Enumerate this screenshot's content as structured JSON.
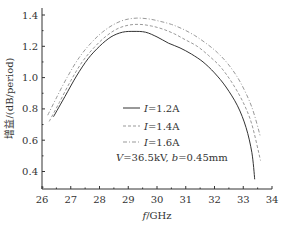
{
  "chart_data": {
    "type": "line",
    "title": "",
    "xlabel": "f/GHz",
    "ylabel": "增益/(dB/period)",
    "xlim": [
      26,
      34
    ],
    "ylim": [
      0.29,
      1.42
    ],
    "xticks": [
      26,
      27,
      28,
      29,
      30,
      31,
      32,
      33,
      34
    ],
    "yticks": [
      0.4,
      0.6,
      0.8,
      1.0,
      1.2,
      1.4
    ],
    "xtick_labels": [
      "26",
      "27",
      "28",
      "29",
      "30",
      "31",
      "32",
      "33",
      "34"
    ],
    "ytick_labels": [
      "0.4",
      "0.6",
      "0.8",
      "1.0",
      "1.2",
      "1.4"
    ],
    "grid": false,
    "legend_position": "center-right, inside",
    "annotation": "V=36.5kV, b=0.45mm",
    "series": [
      {
        "name": "I=1.2A",
        "style": "solid",
        "color": "#333333",
        "x": [
          26.4,
          26.8,
          27.2,
          27.6,
          28.0,
          28.4,
          28.8,
          29.2,
          29.6,
          30.0,
          30.4,
          30.8,
          31.2,
          31.6,
          32.0,
          32.4,
          32.8,
          33.1,
          33.3,
          33.4
        ],
        "y": [
          0.75,
          0.88,
          1.01,
          1.12,
          1.2,
          1.26,
          1.29,
          1.295,
          1.29,
          1.26,
          1.22,
          1.19,
          1.15,
          1.1,
          1.03,
          0.94,
          0.82,
          0.68,
          0.52,
          0.35
        ]
      },
      {
        "name": "I=1.4A",
        "style": "dashed",
        "color": "#999999",
        "x": [
          26.25,
          26.6,
          27.0,
          27.4,
          27.8,
          28.2,
          28.6,
          29.0,
          29.4,
          29.8,
          30.2,
          30.6,
          31.0,
          31.4,
          31.8,
          32.2,
          32.6,
          33.0,
          33.3,
          33.6
        ],
        "y": [
          0.72,
          0.84,
          0.98,
          1.1,
          1.19,
          1.26,
          1.31,
          1.335,
          1.34,
          1.33,
          1.31,
          1.28,
          1.24,
          1.2,
          1.14,
          1.07,
          0.97,
          0.84,
          0.7,
          0.47
        ]
      },
      {
        "name": "I=1.6A",
        "style": "dash-dot",
        "color": "#999999",
        "x": [
          26.2,
          26.5,
          26.9,
          27.3,
          27.7,
          28.1,
          28.5,
          28.9,
          29.3,
          29.7,
          30.1,
          30.5,
          30.9,
          31.3,
          31.7,
          32.1,
          32.5,
          32.9,
          33.3,
          33.6
        ],
        "y": [
          0.76,
          0.87,
          1.01,
          1.13,
          1.22,
          1.29,
          1.34,
          1.37,
          1.38,
          1.375,
          1.36,
          1.34,
          1.31,
          1.27,
          1.22,
          1.16,
          1.08,
          0.97,
          0.81,
          0.62
        ]
      }
    ]
  },
  "legend": {
    "items": [
      {
        "label_var": "I",
        "label_value": "=1.2A",
        "style": "solid"
      },
      {
        "label_var": "I",
        "label_value": "=1.4A",
        "style": "dashed"
      },
      {
        "label_var": "I",
        "label_value": "=1.6A",
        "style": "dash-dot"
      }
    ],
    "annotation_v_var": "V",
    "annotation_v_value": "=36.5kV, ",
    "annotation_b_var": "b",
    "annotation_b_value": "=0.45mm"
  },
  "axes": {
    "xlabel_var": "f",
    "xlabel_unit": "/GHz",
    "ylabel_cn": "增益",
    "ylabel_unit": "/(dB/period)"
  }
}
